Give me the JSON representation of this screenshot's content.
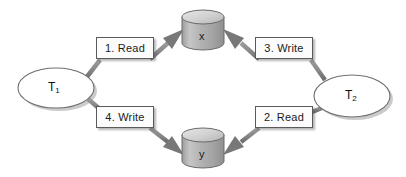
{
  "diagram": {
    "type": "node-link-diagram",
    "background_color": "#ffffff",
    "transactions": [
      {
        "id": "T1",
        "label": "T",
        "subscript": "1",
        "shape": "ellipse",
        "position": {
          "cx": 56,
          "cy": 88,
          "rx": 38,
          "ry": 20
        }
      },
      {
        "id": "T2",
        "label": "T",
        "subscript": "2",
        "shape": "ellipse",
        "position": {
          "cx": 352,
          "cy": 96,
          "rx": 38,
          "ry": 21
        }
      }
    ],
    "data_items": [
      {
        "id": "x",
        "label": "x",
        "shape": "cylinder",
        "position": {
          "cx": 203,
          "cy": 30,
          "rx": 21,
          "height": 26
        }
      },
      {
        "id": "y",
        "label": "y",
        "shape": "cylinder",
        "position": {
          "cx": 203,
          "cy": 148,
          "rx": 21,
          "height": 26
        }
      }
    ],
    "operations": [
      {
        "step": 1,
        "label": "1. Read",
        "from": "T1",
        "to": "x",
        "arrow_direction": "up-right",
        "box_id": "label-read-x"
      },
      {
        "step": 2,
        "label": "2. Read",
        "from": "T2",
        "to": "y",
        "arrow_direction": "down-left",
        "box_id": "label-read-y"
      },
      {
        "step": 3,
        "label": "3. Write",
        "from": "T2",
        "to": "x",
        "arrow_direction": "up-left",
        "box_id": "label-write-x"
      },
      {
        "step": 4,
        "label": "4. Write",
        "from": "T1",
        "to": "y",
        "arrow_direction": "down-right",
        "box_id": "label-write-y"
      }
    ],
    "colors": {
      "connector": "#8a8a8a",
      "connector_dark": "#6e6e6e",
      "box_fill": "#fcfcfc",
      "box_border": "#5a5a5a",
      "cylinder_body": "#b5b5b5",
      "cylinder_top": "#d8d8d8",
      "ellipse_fill": "#ffffff",
      "ellipse_border": "#6f6f6f",
      "shadow": "#a8a8a8",
      "text": "#1a1a1a"
    }
  }
}
